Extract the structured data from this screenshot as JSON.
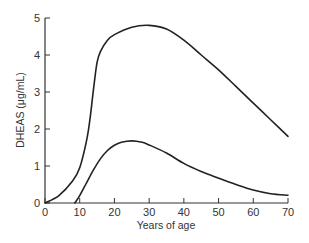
{
  "chart_data": {
    "type": "line",
    "title": "",
    "xlabel": "Years of age",
    "ylabel": "DHEAS (μg/mL)",
    "xlim": [
      0,
      70
    ],
    "ylim": [
      0,
      5
    ],
    "x_ticks": [
      "0",
      "10",
      "20",
      "30",
      "40",
      "50",
      "60",
      "70"
    ],
    "y_ticks": [
      "0",
      "1",
      "2",
      "3",
      "4",
      "5"
    ],
    "grid": false,
    "legend": null,
    "series": [
      {
        "name": "upper curve",
        "points": [
          [
            0,
            0
          ],
          [
            4,
            0.2
          ],
          [
            8,
            0.6
          ],
          [
            10,
            0.95
          ],
          [
            12,
            1.7
          ],
          [
            13,
            2.3
          ],
          [
            14,
            3.1
          ],
          [
            15,
            3.8
          ],
          [
            16,
            4.1
          ],
          [
            18,
            4.4
          ],
          [
            20,
            4.55
          ],
          [
            25,
            4.75
          ],
          [
            30,
            4.8
          ],
          [
            35,
            4.7
          ],
          [
            40,
            4.4
          ],
          [
            45,
            4.0
          ],
          [
            50,
            3.6
          ],
          [
            55,
            3.15
          ],
          [
            60,
            2.7
          ],
          [
            65,
            2.25
          ],
          [
            70,
            1.8
          ]
        ]
      },
      {
        "name": "lower curve",
        "points": [
          [
            8.6,
            0
          ],
          [
            10,
            0.2
          ],
          [
            12,
            0.55
          ],
          [
            14,
            0.9
          ],
          [
            16,
            1.2
          ],
          [
            18,
            1.42
          ],
          [
            20,
            1.56
          ],
          [
            22,
            1.64
          ],
          [
            25,
            1.68
          ],
          [
            28,
            1.64
          ],
          [
            30,
            1.57
          ],
          [
            35,
            1.35
          ],
          [
            40,
            1.07
          ],
          [
            45,
            0.85
          ],
          [
            50,
            0.67
          ],
          [
            55,
            0.5
          ],
          [
            60,
            0.35
          ],
          [
            65,
            0.25
          ],
          [
            70,
            0.21
          ]
        ]
      }
    ]
  },
  "style": {
    "line_color": "#222222",
    "axis_color": "#333333"
  }
}
